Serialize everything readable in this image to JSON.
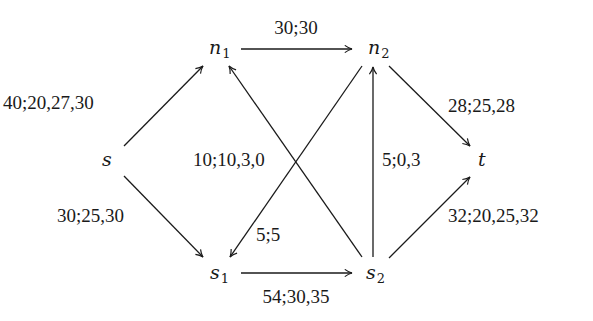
{
  "diagram": {
    "type": "flow-network",
    "nodes": [
      {
        "id": "n1",
        "name": "n",
        "sub": "1",
        "x": 209,
        "y": 54
      },
      {
        "id": "n2",
        "name": "n",
        "sub": "2",
        "x": 368,
        "y": 54
      },
      {
        "id": "s",
        "name": "s",
        "sub": "",
        "x": 102,
        "y": 166
      },
      {
        "id": "t",
        "name": "t",
        "sub": "",
        "x": 478,
        "y": 166
      },
      {
        "id": "s1",
        "name": "s",
        "sub": "1",
        "x": 210,
        "y": 279
      },
      {
        "id": "s2",
        "name": "s",
        "sub": "2",
        "x": 366,
        "y": 279
      }
    ],
    "edges": [
      {
        "from": "s",
        "to": "n1",
        "label": "40;20,27,30",
        "x1": 124,
        "y1": 146,
        "x2": 203,
        "y2": 66,
        "lx": 3,
        "ly": 109,
        "anchor": "start"
      },
      {
        "from": "s",
        "to": "s1",
        "label": "30;25,30",
        "x1": 124,
        "y1": 176,
        "x2": 203,
        "y2": 257,
        "lx": 57,
        "ly": 222,
        "anchor": "start"
      },
      {
        "from": "n1",
        "to": "n2",
        "label": "30;30",
        "x1": 241,
        "y1": 49,
        "x2": 352,
        "y2": 49,
        "lx": 296,
        "ly": 34,
        "anchor": "middle"
      },
      {
        "from": "s1",
        "to": "s2",
        "label": "54;30,35",
        "x1": 241,
        "y1": 273,
        "x2": 352,
        "y2": 273,
        "lx": 296,
        "ly": 303,
        "anchor": "middle"
      },
      {
        "from": "n2",
        "to": "s1",
        "label": "5;5",
        "x1": 362,
        "y1": 66,
        "x2": 230,
        "y2": 257,
        "lx": 256,
        "ly": 241,
        "anchor": "start"
      },
      {
        "from": "s2",
        "to": "n1",
        "label": "10;10,3,0",
        "x1": 362,
        "y1": 257,
        "x2": 229,
        "y2": 66,
        "lx": 193,
        "ly": 166,
        "anchor": "start"
      },
      {
        "from": "s2",
        "to": "n2",
        "label": "5;0,3",
        "x1": 373,
        "y1": 257,
        "x2": 373,
        "y2": 67,
        "lx": 382,
        "ly": 166,
        "anchor": "start"
      },
      {
        "from": "n2",
        "to": "t",
        "label": "28;25,28",
        "x1": 389,
        "y1": 66,
        "x2": 470,
        "y2": 146,
        "lx": 448,
        "ly": 112,
        "anchor": "start"
      },
      {
        "from": "s2",
        "to": "t",
        "label": "32;20,25,32",
        "x1": 389,
        "y1": 258,
        "x2": 470,
        "y2": 177,
        "lx": 448,
        "ly": 222,
        "anchor": "start"
      }
    ]
  },
  "colors": {
    "ink": "#1a1a1a",
    "background": "#ffffff"
  }
}
